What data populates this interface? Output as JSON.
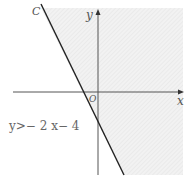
{
  "diagram": {
    "type": "linear-inequality-graph",
    "line_label": "C",
    "axis_x_label": "x",
    "axis_y_label": "y",
    "origin_label": "O",
    "inequality_text": "y>− 2 x− 4",
    "line_equation": {
      "slope": -2,
      "intercept": -4
    },
    "shaded_side": "above-right of line",
    "colors": {
      "line": "#222222",
      "axes": "#555555",
      "shade": "#ececec"
    }
  }
}
